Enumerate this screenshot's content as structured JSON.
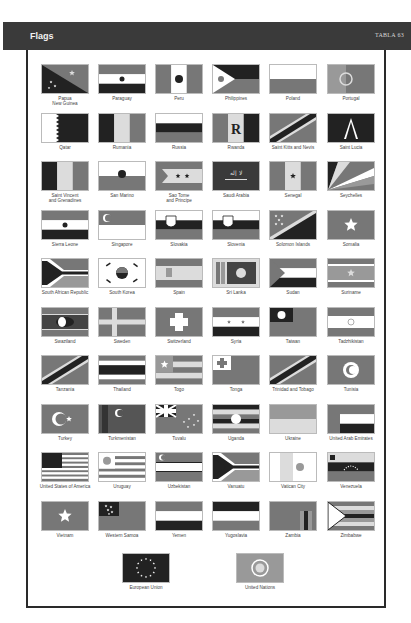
{
  "header": {
    "title": "Flags",
    "page_label": "TABLA 63"
  },
  "flags": [
    [
      {
        "name": "Papua\nNew Guinea",
        "style": "diag-dark"
      },
      {
        "name": "Paraguay",
        "style": "tri-h"
      },
      {
        "name": "Peru",
        "style": "tri-v-white-center"
      },
      {
        "name": "Philippines",
        "style": "triangle-left"
      },
      {
        "name": "Poland",
        "style": "bi-h"
      },
      {
        "name": "Portugal",
        "style": "solid-emblem"
      }
    ],
    [
      {
        "name": "Qatar",
        "style": "serrated"
      },
      {
        "name": "Rumania",
        "style": "tri-v"
      },
      {
        "name": "Russia",
        "style": "tri-h-dark-mid"
      },
      {
        "name": "Rwanda",
        "style": "tri-v-letter"
      },
      {
        "name": "Saint Kitts and Nevis",
        "style": "diag-band"
      },
      {
        "name": "Saint Lucia",
        "style": "solid-triangle"
      }
    ],
    [
      {
        "name": "Saint Vincent\nand Grenadines",
        "style": "tri-v"
      },
      {
        "name": "San Marino",
        "style": "bi-h-emblem"
      },
      {
        "name": "Sao Tome\nand Principe",
        "style": "chevron-stars"
      },
      {
        "name": "Saudi Arabia",
        "style": "solid-dark-script"
      },
      {
        "name": "Senegal",
        "style": "tri-v-star"
      },
      {
        "name": "Seychelles",
        "style": "rays"
      }
    ],
    [
      {
        "name": "Sierra Leone",
        "style": "tri-h"
      },
      {
        "name": "Singapore",
        "style": "bi-h-crescent"
      },
      {
        "name": "Slovakia",
        "style": "tri-h-shield"
      },
      {
        "name": "Slovenia",
        "style": "tri-h-shield"
      },
      {
        "name": "Solomon Islands",
        "style": "diag-band-stars"
      },
      {
        "name": "Somalia",
        "style": "solid-star"
      }
    ],
    [
      {
        "name": "South African Republic",
        "style": "y-shape"
      },
      {
        "name": "South Korea",
        "style": "taeguk"
      },
      {
        "name": "Spain",
        "style": "tri-h-wide"
      },
      {
        "name": "Sri Lanka",
        "style": "lion-panel"
      },
      {
        "name": "Sudan",
        "style": "tri-h-triangle"
      },
      {
        "name": "Suriname",
        "style": "stripes-star"
      }
    ],
    [
      {
        "name": "Swaziland",
        "style": "shield-stripes"
      },
      {
        "name": "Sweden",
        "style": "nordic-cross"
      },
      {
        "name": "Switzerland",
        "style": "swiss-cross"
      },
      {
        "name": "Syria",
        "style": "tri-h-two-stars"
      },
      {
        "name": "Taiwan",
        "style": "canton-sun"
      },
      {
        "name": "Tadzhikistan",
        "style": "tri-h-emblem"
      }
    ],
    [
      {
        "name": "Tanzania",
        "style": "diag-band"
      },
      {
        "name": "Thailand",
        "style": "thai-stripes"
      },
      {
        "name": "Togo",
        "style": "stripes-canton-star"
      },
      {
        "name": "Tonga",
        "style": "canton-cross"
      },
      {
        "name": "Trinidad and Tobago",
        "style": "diag-band"
      },
      {
        "name": "Tunisia",
        "style": "solid-crescent"
      }
    ],
    [
      {
        "name": "Turkey",
        "style": "solid-crescent-side"
      },
      {
        "name": "Turkmenistan",
        "style": "carpet-crescent"
      },
      {
        "name": "Tuvalu",
        "style": "union-stars"
      },
      {
        "name": "Uganda",
        "style": "six-stripes"
      },
      {
        "name": "Ukraine",
        "style": "bi-h-light"
      },
      {
        "name": "United Arab Emirates",
        "style": "uae"
      }
    ],
    [
      {
        "name": "United States of America",
        "style": "usa"
      },
      {
        "name": "Uruguay",
        "style": "uruguay"
      },
      {
        "name": "Uzbekistan",
        "style": "tri-h-crescent"
      },
      {
        "name": "Vanuatu",
        "style": "y-shape"
      },
      {
        "name": "Vatican City",
        "style": "bi-v-emblem"
      },
      {
        "name": "Venezuela",
        "style": "tri-h-arc-stars"
      }
    ],
    [
      {
        "name": "Vietnam",
        "style": "solid-star"
      },
      {
        "name": "Western Samoa",
        "style": "canton-stars"
      },
      {
        "name": "Yemen",
        "style": "tri-h-dark-bottom"
      },
      {
        "name": "Yugoslavia",
        "style": "tri-h-dark-top"
      },
      {
        "name": "Zambia",
        "style": "solid-bars-right"
      },
      {
        "name": "Zimbabwe",
        "style": "zimbabwe"
      }
    ]
  ],
  "bottom_flags": [
    {
      "name": "European Union",
      "style": "eu"
    },
    {
      "name": "United Nations",
      "style": "un"
    }
  ]
}
